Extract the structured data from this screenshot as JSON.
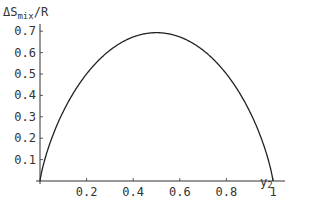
{
  "chart_data": {
    "type": "line",
    "title": "",
    "xlabel": "y₂",
    "ylabel": "ΔS_mix/R",
    "ylabel_parts": {
      "main": "ΔS",
      "subscript": "mix",
      "suffix": "/R"
    },
    "xlabel_parts": {
      "main": "y",
      "subscript": "2"
    },
    "xlim": [
      0,
      1
    ],
    "ylim": [
      0,
      0.7
    ],
    "x_ticks": [
      "0.2",
      "0.4",
      "0.6",
      "0.8",
      "1"
    ],
    "x_tick_values": [
      0.2,
      0.4,
      0.6,
      0.8,
      1.0
    ],
    "y_ticks": [
      "0.1",
      "0.2",
      "0.3",
      "0.4",
      "0.5",
      "0.6",
      "0.7"
    ],
    "y_tick_values": [
      0.1,
      0.2,
      0.3,
      0.4,
      0.5,
      0.6,
      0.7
    ],
    "grid": false,
    "legend": null,
    "series": [
      {
        "name": "ΔS_mix/R = -[y ln y + (1-y) ln(1-y)]",
        "color": "#222222",
        "x": [
          0,
          0.01,
          0.05,
          0.1,
          0.2,
          0.3,
          0.4,
          0.5,
          0.6,
          0.7,
          0.8,
          0.9,
          0.95,
          0.99,
          1
        ],
        "values": [
          0,
          0.056,
          0.199,
          0.325,
          0.5,
          0.611,
          0.673,
          0.693,
          0.673,
          0.611,
          0.5,
          0.325,
          0.199,
          0.056,
          0
        ]
      }
    ]
  }
}
